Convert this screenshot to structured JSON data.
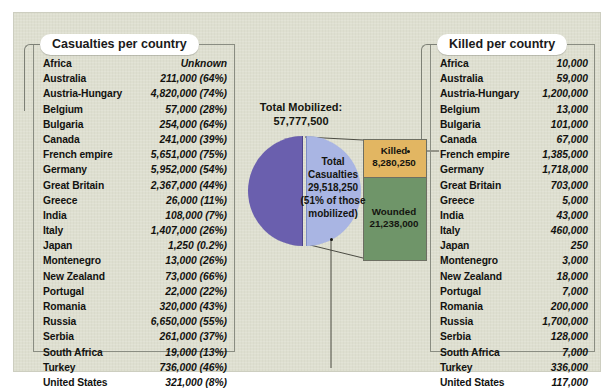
{
  "left_panel": {
    "title": "Casualties per country",
    "columns": [
      "Country",
      "Casualties"
    ],
    "rows": [
      {
        "country": "Africa",
        "value": "Unknown"
      },
      {
        "country": "Australia",
        "value": "211,000 (64%)"
      },
      {
        "country": "Austria-Hungary",
        "value": "4,820,000 (74%)"
      },
      {
        "country": "Belgium",
        "value": "57,000 (28%)"
      },
      {
        "country": "Bulgaria",
        "value": "254,000 (64%)"
      },
      {
        "country": "Canada",
        "value": "241,000 (39%)"
      },
      {
        "country": "French empire",
        "value": "5,651,000 (75%)"
      },
      {
        "country": "Germany",
        "value": "5,952,000 (54%)"
      },
      {
        "country": "Great Britain",
        "value": "2,367,000 (44%)"
      },
      {
        "country": "Greece",
        "value": "26,000 (11%)"
      },
      {
        "country": "India",
        "value": "108,000 (7%)"
      },
      {
        "country": "Italy",
        "value": "1,407,000 (26%)"
      },
      {
        "country": "Japan",
        "value": "1,250 (0.2%)"
      },
      {
        "country": "Montenegro",
        "value": "13,000 (26%)"
      },
      {
        "country": "New Zealand",
        "value": "73,000 (66%)"
      },
      {
        "country": "Portugal",
        "value": "22,000 (22%)"
      },
      {
        "country": "Romania",
        "value": "320,000 (43%)"
      },
      {
        "country": "Russia",
        "value": "6,650,000 (55%)"
      },
      {
        "country": "Serbia",
        "value": "261,000 (37%)"
      },
      {
        "country": "South Africa",
        "value": "19,000 (13%)"
      },
      {
        "country": "Turkey",
        "value": "736,000 (46%)"
      },
      {
        "country": "United States",
        "value": "321,000 (8%)"
      }
    ]
  },
  "right_panel": {
    "title": "Killed per country",
    "columns": [
      "Country",
      "Killed"
    ],
    "rows": [
      {
        "country": "Africa",
        "value": "10,000"
      },
      {
        "country": "Australia",
        "value": "59,000"
      },
      {
        "country": "Austria-Hungary",
        "value": "1,200,000"
      },
      {
        "country": "Belgium",
        "value": "13,000"
      },
      {
        "country": "Bulgaria",
        "value": "101,000"
      },
      {
        "country": "Canada",
        "value": "67,000"
      },
      {
        "country": "French empire",
        "value": "1,385,000"
      },
      {
        "country": "Germany",
        "value": "1,718,000"
      },
      {
        "country": "Great Britain",
        "value": "703,000"
      },
      {
        "country": "Greece",
        "value": "5,000"
      },
      {
        "country": "India",
        "value": "43,000"
      },
      {
        "country": "Italy",
        "value": "460,000"
      },
      {
        "country": "Japan",
        "value": "250"
      },
      {
        "country": "Montenegro",
        "value": "3,000"
      },
      {
        "country": "New Zealand",
        "value": "18,000"
      },
      {
        "country": "Portugal",
        "value": "7,000"
      },
      {
        "country": "Romania",
        "value": "200,000"
      },
      {
        "country": "Russia",
        "value": "1,700,000"
      },
      {
        "country": "Serbia",
        "value": "128,000"
      },
      {
        "country": "South Africa",
        "value": "7,000"
      },
      {
        "country": "Turkey",
        "value": "336,000"
      },
      {
        "country": "United States",
        "value": "117,000"
      }
    ]
  },
  "center": {
    "total_label": "Total Mobilized:",
    "total_value": "57,777,500",
    "pie_text": "Total Casualties 29,518,250 (51% of those mobilized)",
    "killed_label": "Killed",
    "killed_value": "8,280,250",
    "wounded_label": "Wounded",
    "wounded_value": "21,238,000"
  },
  "colors": {
    "background": "#dedfd0",
    "pie_mobilized": "#6a5fae",
    "pie_casualties": "#a9b5e3",
    "killed": "#e2b662",
    "wounded": "#6f9569",
    "frame": "#8a8d82"
  },
  "chart_data": {
    "type": "pie",
    "title": "Total Mobilized: 57,777,500",
    "total_mobilized": 57777500,
    "slices": [
      {
        "label": "Not a casualty",
        "value": 28259250,
        "percent": 49,
        "color": "#6a5fae"
      },
      {
        "label": "Total Casualties",
        "value": 29518250,
        "percent": 51,
        "color": "#a9b5e3"
      }
    ],
    "breakdown": {
      "type": "bar",
      "parent": "Total Casualties",
      "categories": [
        "Killed",
        "Wounded"
      ],
      "values": [
        8280250,
        21238000
      ],
      "colors": [
        "#e2b662",
        "#6f9569"
      ]
    },
    "legend": "inline",
    "grid": false
  }
}
